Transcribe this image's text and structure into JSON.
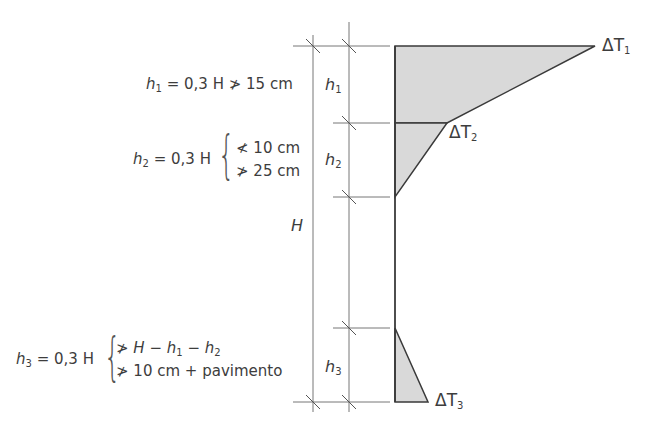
{
  "diagram": {
    "type": "thermal gradient dimension diagram",
    "colors": {
      "line": "#3a3a3a",
      "fill": "#d8d8d8",
      "dim_line": "#666666"
    },
    "formulas": {
      "h1": {
        "lhs": "h",
        "sub": "1",
        "rhs": "= 0,3 H",
        "cond": "⋡ 15 cm",
        "cond_sym": "≯",
        "cond_text": "15 cm"
      },
      "h2": {
        "lhs": "h",
        "sub": "2",
        "rhs": "= 0,3 H",
        "cond1_sym": "≮",
        "cond1_text": "10 cm",
        "cond2_sym": "≯",
        "cond2_text": "25 cm"
      },
      "h3": {
        "lhs": "h",
        "sub": "3",
        "rhs": "= 0,3 H",
        "cond1_sym": "≯",
        "cond1_text_a": "H − h",
        "cond1_sub_a": "1",
        "cond1_text_b": " − h",
        "cond1_sub_b": "2",
        "cond2_sym": "≯",
        "cond2_text": "10 cm + pavimento"
      }
    },
    "dimension_labels": {
      "H": "H",
      "h1": {
        "text": "h",
        "sub": "1"
      },
      "h2": {
        "text": "h",
        "sub": "2"
      },
      "h3": {
        "text": "h",
        "sub": "3"
      }
    },
    "temperature_labels": {
      "dT1": {
        "text": "ΔT",
        "sub": "1"
      },
      "dT2": {
        "text": "ΔT",
        "sub": "2"
      },
      "dT3": {
        "text": "ΔT",
        "sub": "3"
      }
    }
  }
}
